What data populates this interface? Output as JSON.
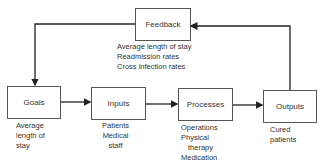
{
  "feedback": {
    "title": "Feedback",
    "items": [
      "Average length of stay",
      "Readmission rates",
      "Cross infection rates"
    ]
  },
  "nodes": [
    {
      "title": "Goals",
      "lines": [
        "Average",
        "length of",
        "stay"
      ]
    },
    {
      "title": "Inputs",
      "lines": [
        "Patients",
        "Medical",
        "staff"
      ]
    },
    {
      "title": "Processes",
      "lines": [
        "Operations",
        "Physical",
        "therapy",
        "Medication"
      ]
    },
    {
      "title": "Outputs",
      "lines": [
        "Cured",
        "patients"
      ]
    }
  ],
  "colors": {
    "line": "#222222",
    "box_border": "#555555",
    "text": "#333333"
  }
}
